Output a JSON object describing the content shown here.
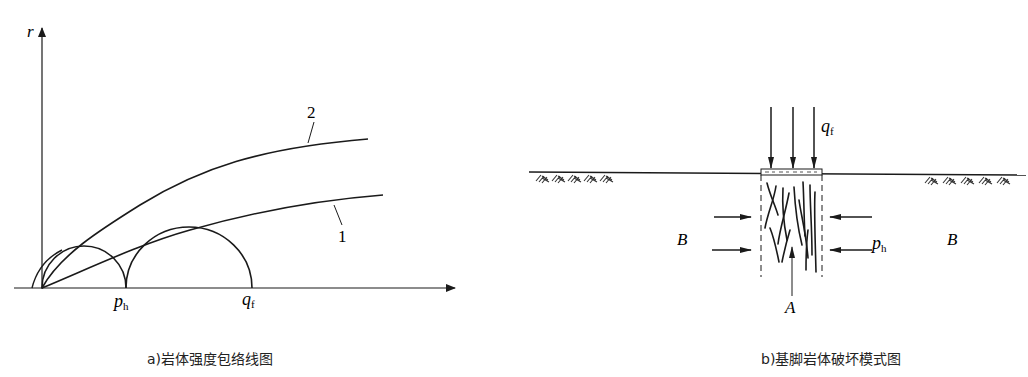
{
  "panel_a": {
    "caption": "a)岩体强度包络线图",
    "y_axis_label": "r",
    "x_ticks": [
      {
        "symbol": "p",
        "subscript": "h"
      },
      {
        "symbol": "q",
        "subscript": "f"
      }
    ],
    "curve_labels": [
      "2",
      "1"
    ],
    "curves": [
      {
        "id": "1",
        "description": "lower strength envelope tangent to Mohr circles"
      },
      {
        "id": "2",
        "description": "upper strength envelope"
      }
    ],
    "mohr_circles": [
      {
        "from": "0",
        "to": "p_h"
      },
      {
        "from": "p_h",
        "to": "q_f"
      }
    ]
  },
  "panel_b": {
    "caption": "b)基脚岩体破坏模式图",
    "load_label": {
      "symbol": "q",
      "subscript": "f"
    },
    "lateral_label": {
      "symbol": "p",
      "subscript": "h"
    },
    "zone_labels": {
      "left": "B",
      "right": "B",
      "center": "A"
    }
  },
  "colors": {
    "stroke": "#1a1a1a",
    "background": "#ffffff"
  }
}
